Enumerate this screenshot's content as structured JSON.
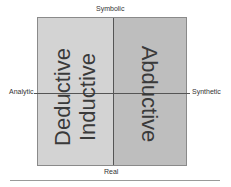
{
  "axes": {
    "top": "Symbolic",
    "bottom": "Real",
    "left": "Analytic",
    "right": "Synthetic"
  },
  "quadrants": {
    "left_primary": "Deductive",
    "left_secondary": "Inductive",
    "right": "Abductive"
  },
  "colors": {
    "left_fill": "#d3d3d3",
    "right_fill": "#bebebe",
    "divider": "#555555"
  }
}
